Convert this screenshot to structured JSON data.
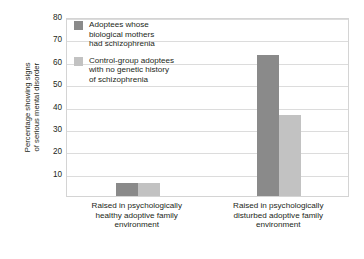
{
  "chart_data": {
    "type": "bar",
    "title": "",
    "xlabel": "",
    "ylabel": "Percentage showing signs\nof serious mental disorder",
    "ylim": [
      0,
      80
    ],
    "yticks": [
      10,
      20,
      30,
      40,
      50,
      60,
      70,
      80
    ],
    "grid": true,
    "legend_position": "top-left-inside",
    "categories": [
      "Raised in psychologically\nhealthy adoptive family\nenvironment",
      "Raised in psychologically\ndisturbed adoptive family\nenvironment"
    ],
    "series": [
      {
        "name": "Adoptees whose\nbiological mothers\nhad schizophrenia",
        "color": "#8a8a8a",
        "values": [
          6,
          63
        ]
      },
      {
        "name": "Control-group adoptees\nwith no genetic history\nof schizophrenia",
        "color": "#c2c2c2",
        "values": [
          6,
          36
        ]
      }
    ]
  },
  "axis": {
    "y_title": "Percentage showing signs\nof serious mental disorder",
    "ticks": [
      {
        "label": "80",
        "value": 80
      },
      {
        "label": "70",
        "value": 70
      },
      {
        "label": "60",
        "value": 60
      },
      {
        "label": "50",
        "value": 50
      },
      {
        "label": "40",
        "value": 40
      },
      {
        "label": "30",
        "value": 30
      },
      {
        "label": "20",
        "value": 20
      },
      {
        "label": "10",
        "value": 10
      }
    ]
  },
  "legend": {
    "entries": [
      {
        "label": "Adoptees whose\nbiological mothers\nhad schizophrenia",
        "color": "#8a8a8a"
      },
      {
        "label": "Control-group adoptees\nwith no genetic history\nof schizophrenia",
        "color": "#c2c2c2"
      }
    ]
  },
  "categories": [
    {
      "label": "Raised in psychologically\nhealthy adoptive family\nenvironment"
    },
    {
      "label": "Raised in psychologically\ndisturbed adoptive family\nenvironment"
    }
  ],
  "colors": {
    "series_dark": "#8a8a8a",
    "series_light": "#c2c2c2",
    "grid": "#dcdcdc",
    "frame": "#d4d4d4",
    "text": "#231f20",
    "background": "#ffffff"
  }
}
